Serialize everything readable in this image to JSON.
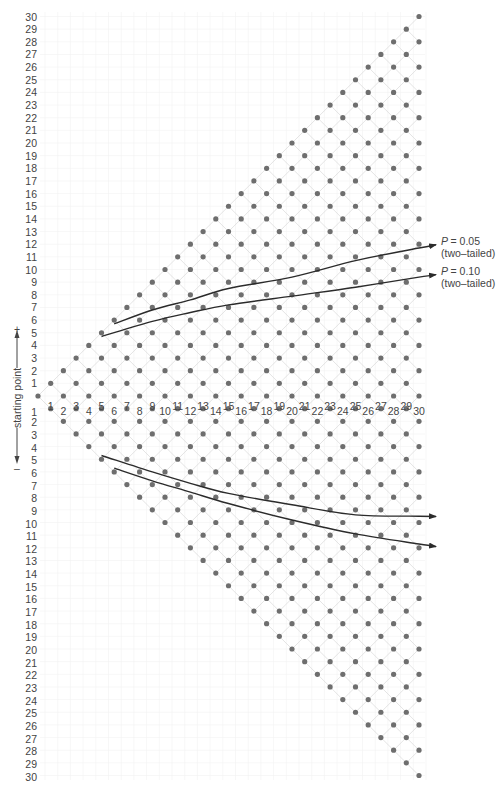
{
  "chart_data": {
    "type": "scatter",
    "title": "",
    "x": {
      "label": "step",
      "ticks": [
        1,
        2,
        3,
        4,
        5,
        6,
        7,
        8,
        9,
        10,
        11,
        12,
        13,
        14,
        15,
        16,
        17,
        18,
        19,
        20,
        21,
        22,
        23,
        24,
        25,
        26,
        27,
        28,
        29,
        30
      ]
    },
    "y": {
      "upper_ticks": [
        1,
        2,
        3,
        4,
        5,
        6,
        7,
        8,
        9,
        10,
        11,
        12,
        13,
        14,
        15,
        16,
        17,
        18,
        19,
        20,
        21,
        22,
        23,
        24,
        25,
        26,
        27,
        28,
        29,
        30
      ],
      "lower_ticks": [
        1,
        2,
        3,
        4,
        5,
        6,
        7,
        8,
        9,
        10,
        11,
        12,
        13,
        14,
        15,
        16,
        17,
        18,
        19,
        20,
        21,
        22,
        23,
        24,
        25,
        26,
        27,
        28,
        29,
        30
      ],
      "range": [
        -30,
        30
      ]
    },
    "axis_label": "starting point",
    "plus_sign": "+",
    "minus_sign": "–",
    "lattice": {
      "max_step": 30,
      "rule": "at step n, points at levels n, n-2, ..., -n"
    },
    "boundaries": [
      {
        "name": "P = 0.05 (two-tailed)",
        "label_line1": "= 0.05",
        "label_line2": "(two–tailed)",
        "upper": [
          [
            6,
            5.7
          ],
          [
            9,
            6.8
          ],
          [
            12,
            7.6
          ],
          [
            15,
            8.5
          ],
          [
            20,
            9.4
          ],
          [
            25,
            10.7
          ],
          [
            30,
            11.7
          ]
        ],
        "lower": [
          [
            5,
            -4.7
          ],
          [
            9,
            -6.0
          ],
          [
            12,
            -6.9
          ],
          [
            15,
            -7.7
          ],
          [
            20,
            -8.6
          ],
          [
            25,
            -9.4
          ],
          [
            30,
            -9.5
          ]
        ]
      },
      {
        "name": "P = 0.10 (two-tailed)",
        "label_line1": "= 0.10",
        "label_line2": "(two–tailed)",
        "upper": [
          [
            5,
            4.7
          ],
          [
            9,
            5.9
          ],
          [
            12,
            6.6
          ],
          [
            15,
            7.2
          ],
          [
            20,
            7.9
          ],
          [
            25,
            8.6
          ],
          [
            30,
            9.4
          ]
        ],
        "lower": [
          [
            6,
            -5.7
          ],
          [
            9,
            -6.7
          ],
          [
            12,
            -7.6
          ],
          [
            15,
            -8.5
          ],
          [
            20,
            -9.8
          ],
          [
            25,
            -10.9
          ],
          [
            30,
            -11.7
          ]
        ]
      }
    ],
    "colors": {
      "dot": "#6e6e6e",
      "lattice_line": "#dddddd",
      "grid": "#f1f1f1",
      "boundary": "#2b2b2b",
      "text": "#444444"
    }
  }
}
